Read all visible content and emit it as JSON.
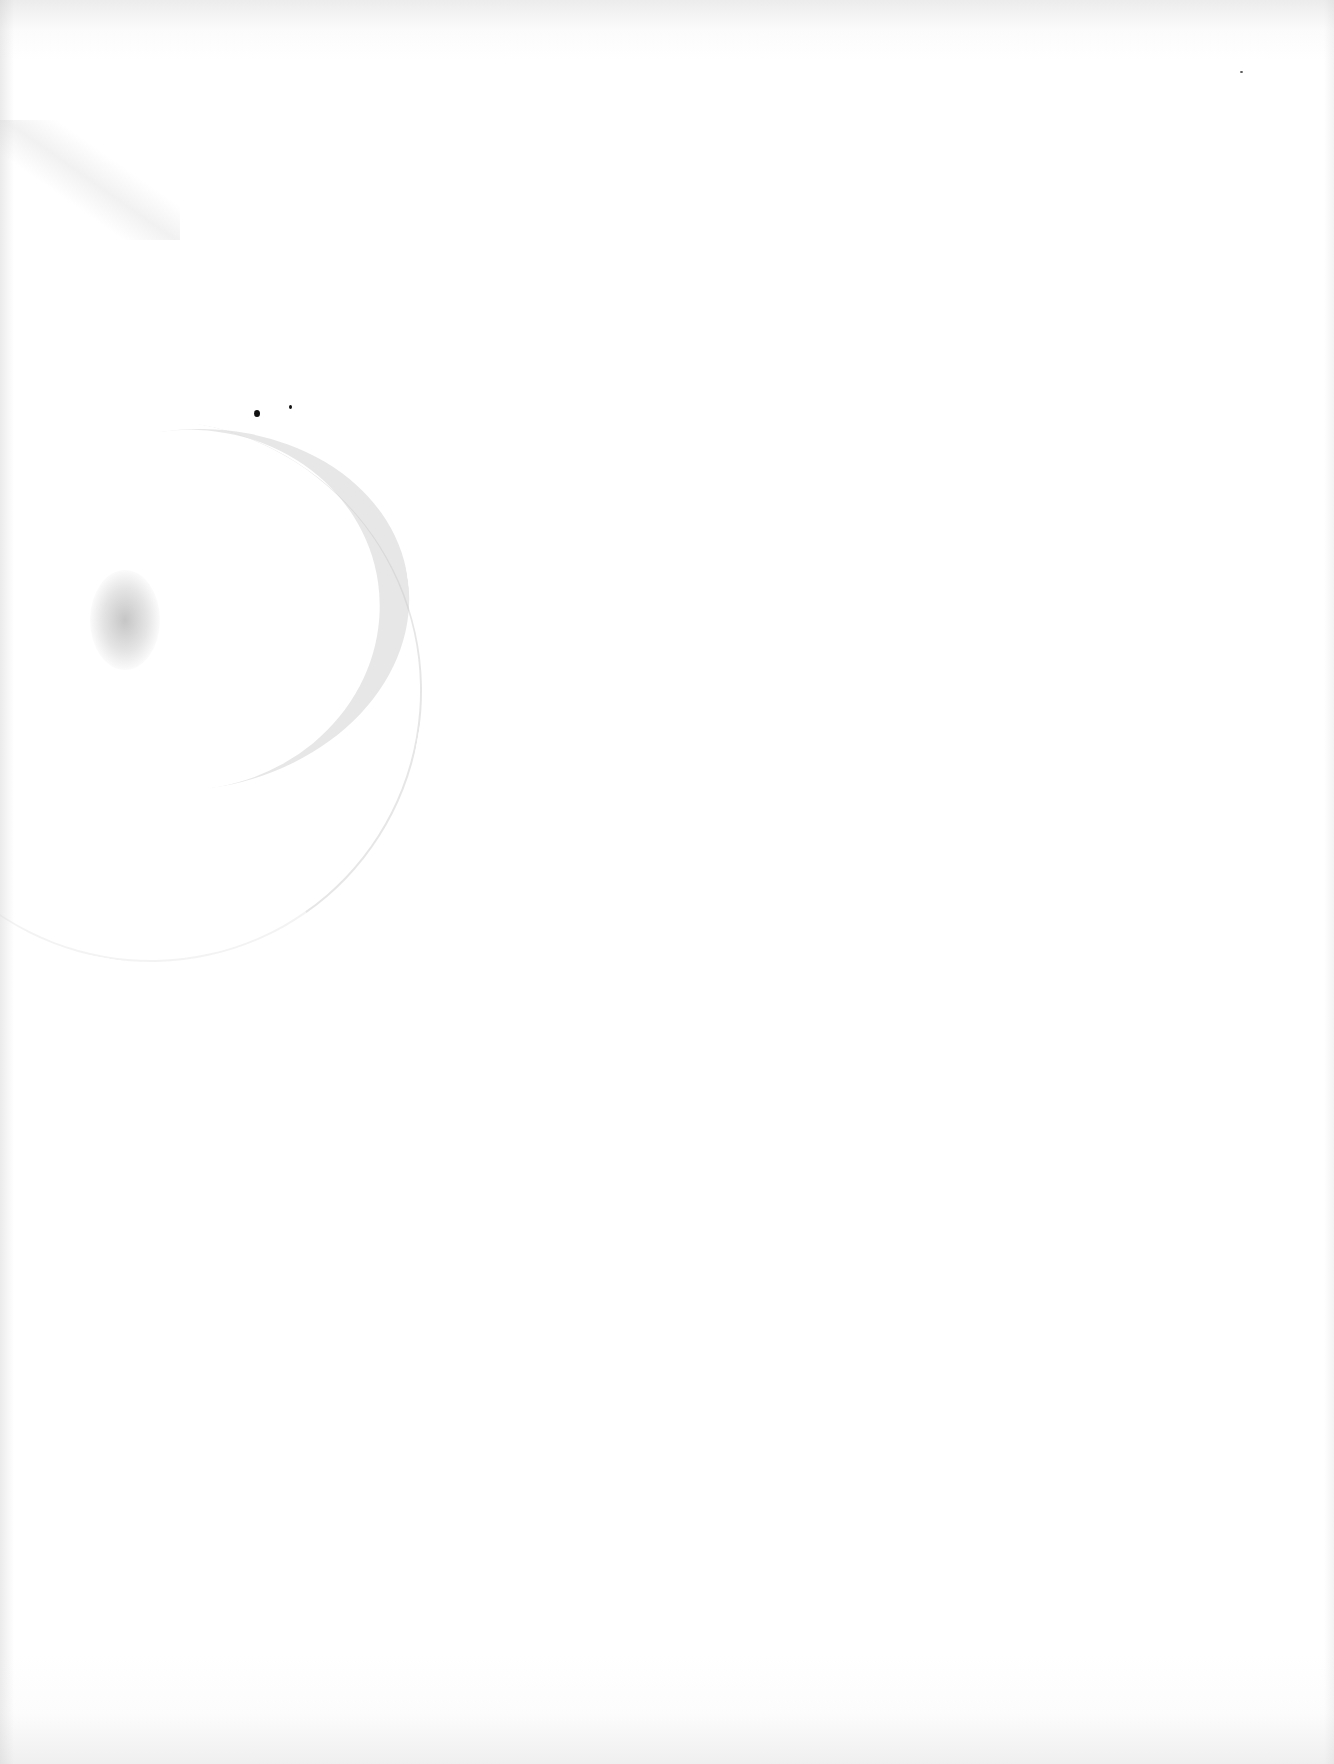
{
  "page": {
    "type": "blank scanned page",
    "text_content": "",
    "background_color": "#ffffff",
    "marks": [
      {
        "name": "stain-blob-left",
        "description": "faint grey speckled blotch"
      },
      {
        "name": "stain-arc-right",
        "description": "faint curved speckled arc"
      },
      {
        "name": "ink-dot-large",
        "description": "small black dot"
      },
      {
        "name": "ink-dot-small",
        "description": "tiny black dot"
      },
      {
        "name": "speckle-trail-top-left",
        "description": "faint diagonal speckles"
      },
      {
        "name": "speck-top-right",
        "description": "tiny dark speck"
      }
    ]
  }
}
